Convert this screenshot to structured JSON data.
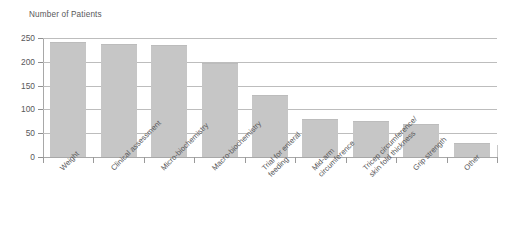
{
  "chart_data": {
    "type": "bar",
    "title": "Number of Patients",
    "xlabel": "",
    "ylabel": "Number of Patients",
    "ylim": [
      0,
      250
    ],
    "yticks": [
      0,
      50,
      100,
      150,
      200,
      250
    ],
    "grid": true,
    "legend": "none",
    "bar_color": "#c6c6c6",
    "categories": [
      "Weight",
      "Clinical assessment",
      "Micro-biochemistry",
      "Macro-biochemistry",
      "Trial for enteral feeding",
      "Mid-arm circumference",
      "Tricep circumference/ skin fold thickness",
      "Grip strength",
      "Other"
    ],
    "category_lines": [
      [
        "Weight",
        ""
      ],
      [
        "Clinical assessment",
        ""
      ],
      [
        "Micro-biochemistry",
        ""
      ],
      [
        "Macro-biochemistry",
        ""
      ],
      [
        "Trial for enteral",
        "feeding"
      ],
      [
        "Mid-arm",
        "circumference"
      ],
      [
        "Tricep circumference/",
        "skin fold thickness"
      ],
      [
        "Grip strength",
        ""
      ],
      [
        "Other",
        ""
      ]
    ],
    "values": [
      241,
      238,
      235,
      197,
      130,
      80,
      75,
      70,
      30
    ]
  },
  "axis": {
    "tick_labels": [
      "250",
      "200",
      "150",
      "100",
      "50",
      "0"
    ]
  }
}
